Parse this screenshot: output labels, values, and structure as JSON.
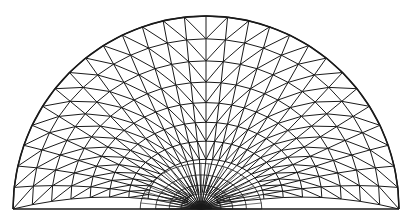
{
  "diagram": {
    "title": "Triangular finite element mesh of a half-disk with local refinement",
    "shape": "half-disk",
    "center": [
      206,
      209
    ],
    "radius": 193,
    "rings": 10,
    "boundary_segments": 28,
    "refinement_point": [
      201,
      204
    ],
    "refinement_rings": 6,
    "refinement_radius": 38,
    "refinement_spokes": 24,
    "stroke_color": "#1a1a1a",
    "background_color": "#ffffff"
  }
}
